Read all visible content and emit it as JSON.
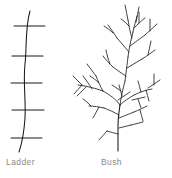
{
  "figure": {
    "background_color": "#ffffff",
    "stroke_color": "#1a1a1a",
    "caption_color": "#8a8a8a",
    "items": [
      {
        "id": "ladder",
        "label": "Ladder",
        "description": "curved vertical spine with five horizontal rungs",
        "rung_count": 5,
        "spine": "M 30,11 C 25,28 27,46 25,64 C 23,82 26,100 25,118 C 24,133 22,143 19,152",
        "rungs": [
          "M 14,26 L 45,26",
          "M 12,56 L 43,56",
          "M 11,83 L 42,83",
          "M 12,110 L 44,110",
          "M 11,138 L 42,138"
        ]
      },
      {
        "id": "bush",
        "label": "Bush",
        "description": "fractal branching shrub with a vertical trunk and recursive twigs",
        "trunk": "M 118,151 L 118,126 C 118,118 119,112 120,105",
        "branches": [
          "M 120,105 C 116,99 110,95 103,91",
          "M 103,91 C 95,88 86,86 78,85",
          "M 92,89 C 89,84 86,80 83,76",
          "M 86,87 C 83,90 80,93 77,96",
          "M 103,91 C 100,86 98,81 96,76",
          "M 96,76 C 93,72 90,68 87,64",
          "M 99,83 C 96,80 93,78 90,76",
          "M 120,105 C 124,101 129,98 134,95",
          "M 134,95 C 140,92 146,90 152,89",
          "M 141,92 C 140,88 139,85 138,81",
          "M 146,90 C 147,94 148,97 149,101",
          "M 120,105 C 121,97 123,89 125,81",
          "M 125,81 C 126,73 127,65 128,57",
          "M 128,57 C 129,48 131,40 133,32",
          "M 133,32 C 134,26 136,21 137,16",
          "M 126,76 C 121,73 117,70 113,67",
          "M 113,67 C 109,63 106,60 103,56",
          "M 110,64 C 108,59 107,55 106,50",
          "M 127,68 C 132,65 137,62 142,59",
          "M 142,59 C 147,56 151,53 155,50",
          "M 148,55 C 149,50 150,46 151,41",
          "M 129,52 C 125,47 121,43 117,38",
          "M 117,38 C 114,33 111,29 108,25",
          "M 113,33 C 110,30 107,28 104,26",
          "M 130,46 C 135,42 140,39 145,35",
          "M 145,35 C 149,31 153,28 157,24",
          "M 150,31 C 150,27 150,23 150,19",
          "M 132,38 C 130,32 129,26 128,20",
          "M 128,20 C 127,15 126,10 125,5",
          "M 129,26 C 126,23 124,21 121,19",
          "M 134,28 C 138,24 141,21 145,18",
          "M 139,23 C 139,19 139,16 139,12",
          "M 136,22 C 137,17 138,12 139,7",
          "M 119,115 C 114,112 109,110 104,108",
          "M 104,108 C 99,107 94,106 89,106",
          "M 99,107 C 97,111 95,114 93,118",
          "M 119,118 C 124,116 129,114 134,112",
          "M 134,112 C 139,110 143,108 147,106",
          "M 140,110 C 141,114 142,117 143,121",
          "M 119,128 C 123,127 127,126 131,125",
          "M 131,125 C 135,124 139,123 143,122",
          "M 118,134 C 114,133 110,132 107,131",
          "M 107,131 C 104,134 102,137 99,140",
          "M 118,100 C 122,97 126,95 130,92",
          "M 122,96 C 121,92 120,89 119,85",
          "M 121,91 C 118,89 115,87 112,85",
          "M 132,100 C 136,99 141,98 145,97",
          "M 138,99 C 139,102 140,105 141,108",
          "M 148,88 C 152,85 156,83 160,80",
          "M 154,85 C 154,81 154,78 154,74",
          "M 82,85 C 79,82 76,79 73,76",
          "M 82,85 C 79,88 77,91 74,94",
          "M 91,106 C 88,103 86,101 83,99"
        ]
      }
    ]
  }
}
